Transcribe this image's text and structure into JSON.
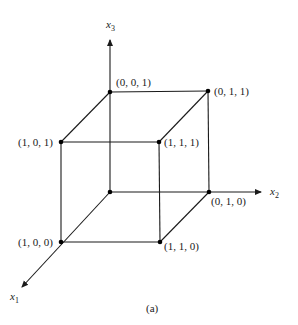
{
  "figure": {
    "caption": "(a)",
    "type": "3D unit cube in x1-x2-x3 coordinate space",
    "axes": {
      "x1": {
        "label": "x",
        "subscript": "1"
      },
      "x2": {
        "label": "x",
        "subscript": "2"
      },
      "x3": {
        "label": "x",
        "subscript": "3"
      }
    },
    "vertices": {
      "v001": {
        "label": "(0, 0, 1)"
      },
      "v011": {
        "label": "(0, 1, 1)"
      },
      "v101": {
        "label": "(1, 0, 1)"
      },
      "v111": {
        "label": "(1, 1, 1)"
      },
      "v010": {
        "label": "(0, 1, 0)"
      },
      "v100": {
        "label": "(1, 0, 0)"
      },
      "v110": {
        "label": "(1, 1, 0)"
      }
    },
    "colors": {
      "ink": "#1a1a1a",
      "background": "#ffffff"
    }
  }
}
